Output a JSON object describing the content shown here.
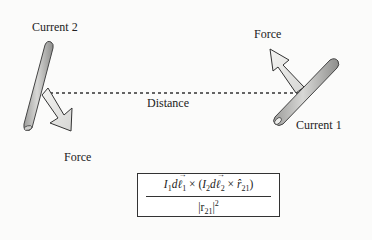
{
  "diagram": {
    "labels": {
      "current_2": "Current 2",
      "current_1": "Current 1",
      "force_top": "Force",
      "force_bottom": "Force",
      "distance": "Distance"
    },
    "formula": {
      "numerator_parts": {
        "i1": "I",
        "i1_sub": "1",
        "dl1_d": "d",
        "dl1_l": "ℓ",
        "dl1_sub": "1",
        "cross1": " × (",
        "i2": "I",
        "i2_sub": "2",
        "dl2_d": "d",
        "dl2_l": "ℓ",
        "dl2_sub": "2",
        "cross2": " × ",
        "rhat": "r̂",
        "rhat_sub": "21",
        "close": ")"
      },
      "denominator_parts": {
        "open": "|r",
        "sub": "21",
        "close": "|",
        "exp": "2"
      }
    },
    "colors": {
      "conductor_fill": "#b5b5b3",
      "conductor_stroke": "#444444",
      "arrow_fill": "#ececea",
      "arrow_stroke": "#333333",
      "dashed_line": "#333333"
    }
  }
}
